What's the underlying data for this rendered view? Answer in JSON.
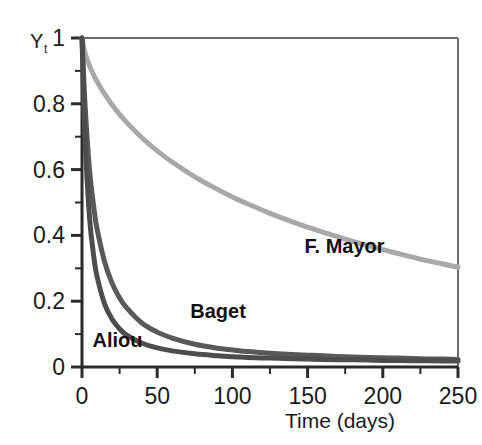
{
  "chart_data": {
    "type": "line",
    "title": "",
    "xlabel": "Time (days)",
    "ylabel": "Y",
    "ylabel_subscript": "t",
    "xlim": [
      0,
      250
    ],
    "ylim": [
      0,
      1
    ],
    "grid": false,
    "legend_position": "inline-annotations",
    "x_ticks": [
      0,
      50,
      100,
      150,
      200,
      250
    ],
    "x_tick_labels": [
      "0",
      "50",
      "100",
      "150",
      "200",
      "250"
    ],
    "x_minor_ticks": [
      25,
      75,
      125,
      175,
      225
    ],
    "y_ticks": [
      0,
      0.2,
      0.4,
      0.6,
      0.8,
      1
    ],
    "y_tick_labels": [
      "0",
      "0.2",
      "0.4",
      "0.6",
      "0.8",
      "1"
    ],
    "y_minor_ticks": [
      0.1,
      0.3,
      0.5,
      0.7,
      0.9
    ],
    "x": [
      0,
      2,
      5,
      8,
      10,
      15,
      20,
      25,
      30,
      40,
      50,
      60,
      75,
      90,
      100,
      110,
      125,
      140,
      150,
      160,
      175,
      190,
      200,
      210,
      225,
      240,
      250
    ],
    "series": [
      {
        "name": "F. Mayor",
        "color": "#a8a8a8",
        "line_width": 5,
        "label_x": 148,
        "label_y": 0.345,
        "values": [
          1.0,
          0.955,
          0.915,
          0.885,
          0.868,
          0.83,
          0.797,
          0.768,
          0.742,
          0.696,
          0.657,
          0.623,
          0.578,
          0.54,
          0.517,
          0.496,
          0.467,
          0.441,
          0.425,
          0.41,
          0.389,
          0.369,
          0.357,
          0.345,
          0.328,
          0.313,
          0.303
        ]
      },
      {
        "name": "Baget",
        "color": "#595959",
        "line_width": 5,
        "label_x": 72,
        "label_y": 0.148,
        "values": [
          1.0,
          0.8,
          0.6,
          0.48,
          0.42,
          0.32,
          0.255,
          0.21,
          0.178,
          0.133,
          0.106,
          0.088,
          0.069,
          0.057,
          0.052,
          0.047,
          0.042,
          0.038,
          0.036,
          0.034,
          0.031,
          0.029,
          0.028,
          0.027,
          0.025,
          0.024,
          0.023
        ]
      },
      {
        "name": "Aliou",
        "color": "#4d4d4d",
        "line_width": 5,
        "label_x": 7,
        "label_y": 0.062,
        "values": [
          1.0,
          0.7,
          0.455,
          0.33,
          0.275,
          0.192,
          0.145,
          0.116,
          0.096,
          0.072,
          0.058,
          0.049,
          0.04,
          0.034,
          0.031,
          0.029,
          0.027,
          0.025,
          0.024,
          0.023,
          0.022,
          0.021,
          0.02,
          0.02,
          0.019,
          0.018,
          0.018
        ]
      }
    ]
  },
  "axes": {
    "frame_color": "#2b2b2b",
    "tick_color": "#2b2b2b"
  }
}
